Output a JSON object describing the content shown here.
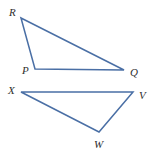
{
  "figure": {
    "background_color": "#ffffff",
    "stroke_color": "#4a6fa5",
    "label_color": "#2e2e2e",
    "stroke_width": 1.5,
    "width": 159,
    "height": 156
  },
  "shapes": [
    {
      "name": "triangle-pqr",
      "label": "Triangle PQR",
      "points": "21,18 35,69 124,70",
      "vertices": [
        {
          "key": "R",
          "label": "R",
          "x": 21,
          "y": 18
        },
        {
          "key": "P",
          "label": "P",
          "x": 35,
          "y": 69
        },
        {
          "key": "Q",
          "label": "Q",
          "x": 124,
          "y": 70
        }
      ]
    },
    {
      "name": "triangle-xvw",
      "label": "Triangle XVW",
      "points": "21,92 133,92 99,132",
      "vertices": [
        {
          "key": "X",
          "label": "X",
          "x": 21,
          "y": 92
        },
        {
          "key": "V",
          "label": "V",
          "x": 133,
          "y": 92
        },
        {
          "key": "W",
          "label": "W",
          "x": 99,
          "y": 132
        }
      ]
    }
  ],
  "labels": {
    "R": "R",
    "P": "P",
    "Q": "Q",
    "X": "X",
    "V": "V",
    "W": "W"
  }
}
